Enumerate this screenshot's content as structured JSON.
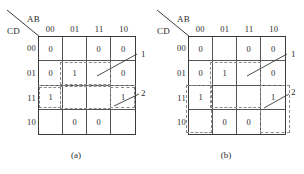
{
  "figure": {
    "maps": [
      {
        "id": "a",
        "caption": "(a)",
        "axis": {
          "top_label": "AB",
          "side_label": "CD"
        },
        "column_headers": [
          "00",
          "01",
          "11",
          "10"
        ],
        "row_headers": [
          "00",
          "01",
          "11",
          "10"
        ],
        "cells": [
          [
            "0",
            "",
            "0",
            "0"
          ],
          [
            "0",
            "1",
            "",
            "0"
          ],
          [
            "1",
            "",
            "",
            "1"
          ],
          [
            "",
            "0",
            "0",
            ""
          ]
        ],
        "callouts": [
          {
            "label": "1"
          },
          {
            "label": "2"
          }
        ]
      },
      {
        "id": "b",
        "caption": "(b)",
        "axis": {
          "top_label": "AB",
          "side_label": "CD"
        },
        "column_headers": [
          "00",
          "01",
          "11",
          "10"
        ],
        "row_headers": [
          "00",
          "01",
          "11",
          "10"
        ],
        "cells": [
          [
            "0",
            "",
            "0",
            "0"
          ],
          [
            "0",
            "1",
            "",
            "0"
          ],
          [
            "1",
            "",
            "",
            "1"
          ],
          [
            "",
            "0",
            "0",
            ""
          ]
        ],
        "callouts": [
          {
            "label": "1"
          },
          {
            "label": "2"
          }
        ]
      }
    ]
  }
}
